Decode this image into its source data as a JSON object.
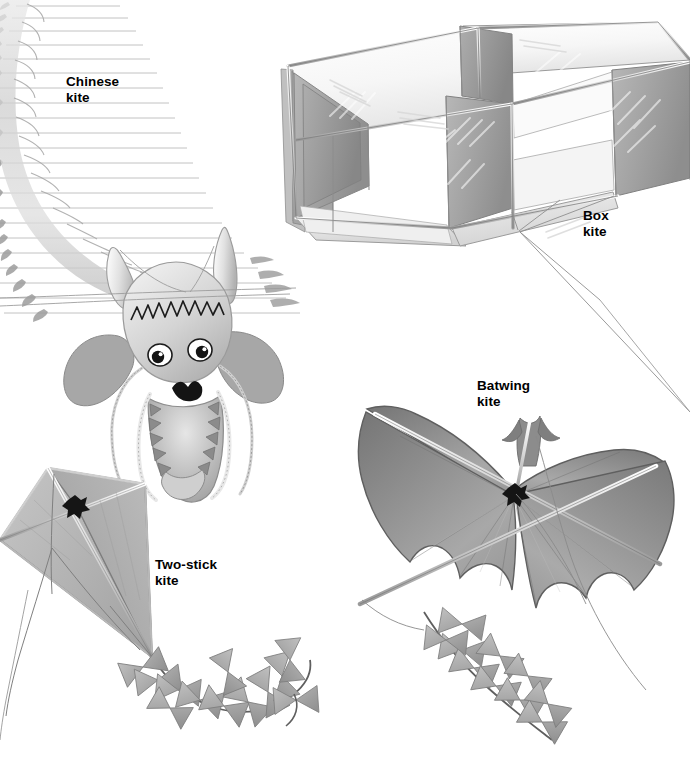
{
  "illustration": {
    "title": "Kite types illustration",
    "background_color": "#ffffff",
    "ink_color": "#000000",
    "width": 690,
    "height": 760
  },
  "labels": {
    "chinese": "Chinese\nkite",
    "box": "Box\nkite",
    "batwing": "Batwing\nkite",
    "twostick": "Two-stick\nkite"
  },
  "kites": [
    {
      "name": "Chinese kite",
      "label_text": "Chinese\nkite",
      "description": "Long curved dragon-body kite with segmented ribbed spine, feathered rib streamers and an ornate dragon head with horns, eyes, whiskers and open toothed mouth.",
      "fill_light": "#f2f2f2",
      "fill_mid": "#c9c9c9",
      "fill_dark": "#8f8f8f"
    },
    {
      "name": "Box kite",
      "label_text": "Box\nkite",
      "description": "Two-cell rectangular box kite in three-quarter perspective with white top/bottom panels, gray vertical side panels, light frame spars and a bridle line running to lower right.",
      "fill_light": "#fbfbfb",
      "fill_mid": "#a9a9a9",
      "fill_dark": "#7d7d7d"
    },
    {
      "name": "Batwing kite",
      "label_text": "Batwing\nkite",
      "description": "Bat-shaped kite with scalloped wing trailing edges, a notched tail fin at top, crossed spars joined by a dark knot at center and a bow-tie tail streaming to the lower left.",
      "fill_light": "#b4b4b4",
      "fill_mid": "#949494",
      "fill_dark": "#6d6d6d"
    },
    {
      "name": "Two-stick kite",
      "label_text": "Two-stick\nkite",
      "description": "Classic diamond kite with vertical spine and horizontal cross spar, bridle strings meeting at a knot, and a bow-tie tail curving to the lower right.",
      "fill_light": "#bdbdbd",
      "fill_mid": "#a0a0a0",
      "fill_dark": "#7a7a7a"
    }
  ],
  "tails": {
    "bowtie_color": "#a8a8a8",
    "string_color": "#6a6a6a",
    "two_stick_bowtie_count": 12,
    "batwing_bowtie_count": 10
  }
}
